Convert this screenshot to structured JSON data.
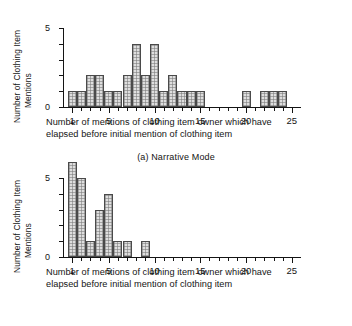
{
  "figure": {
    "axis_titles": {
      "y_line1": "Number of Clothing Item",
      "y_line2": "Mentions",
      "x_line1": "Number of mentions of clothing item owner which have",
      "x_line2": "elapsed before initial mention of clothing item"
    },
    "colors": {
      "ink": "#141414",
      "bar_fill": "#dedede",
      "bar_edge": "#4a4a4a"
    }
  },
  "panels": [
    {
      "id": "panel-a",
      "caption": "(a) Narrative Mode",
      "y_ticklabels": [
        "0",
        "5"
      ],
      "x_ticklabels": [
        "1",
        "5",
        "10",
        "15",
        "20",
        "25"
      ]
    },
    {
      "id": "panel-b",
      "caption": "(b) Descriptive Mode",
      "y_ticklabels": [
        "0",
        "5"
      ],
      "x_ticklabels": [
        "1",
        "5",
        "10",
        "15",
        "20",
        "25"
      ]
    }
  ],
  "chart_data": [
    {
      "type": "bar",
      "title": "(a) Narrative Mode",
      "xlabel": "Number of mentions of clothing item owner which have elapsed before initial mention of clothing item",
      "ylabel": "Number of Clothing Item Mentions",
      "xlim": [
        0,
        26
      ],
      "ylim": [
        0,
        5
      ],
      "xticks": [
        1,
        5,
        10,
        15,
        20,
        25
      ],
      "yticks": [
        0,
        1,
        2,
        3,
        4,
        5
      ],
      "grid": false,
      "legend": null,
      "categories": [
        1,
        2,
        3,
        4,
        5,
        6,
        7,
        8,
        9,
        10,
        11,
        12,
        13,
        14,
        15,
        16,
        17,
        18,
        19,
        20,
        21,
        22,
        23,
        24,
        25
      ],
      "values": [
        1,
        1,
        2,
        2,
        1,
        1,
        2,
        4,
        2,
        4,
        1,
        2,
        1,
        1,
        1,
        0,
        0,
        0,
        0,
        1,
        0,
        1,
        1,
        1,
        0
      ]
    },
    {
      "type": "bar",
      "title": "(b) Descriptive Mode",
      "xlabel": "Number of mentions of clothing item owner which have elapsed before initial mention of clothing item",
      "ylabel": "Number of Clothing Item Mentions",
      "xlim": [
        0,
        26
      ],
      "ylim": [
        0,
        6
      ],
      "xticks": [
        1,
        5,
        10,
        15,
        20,
        25
      ],
      "yticks": [
        0,
        1,
        2,
        3,
        4,
        5
      ],
      "grid": false,
      "legend": null,
      "categories": [
        1,
        2,
        3,
        4,
        5,
        6,
        7,
        8,
        9,
        10,
        11,
        12,
        13,
        14,
        15,
        16,
        17,
        18,
        19,
        20,
        21,
        22,
        23,
        24,
        25
      ],
      "values": [
        6,
        5,
        1,
        3,
        4,
        1,
        1,
        0,
        1,
        0,
        0,
        0,
        0,
        0,
        0,
        0,
        0,
        0,
        0,
        0,
        0,
        0,
        0,
        0,
        0
      ]
    }
  ]
}
